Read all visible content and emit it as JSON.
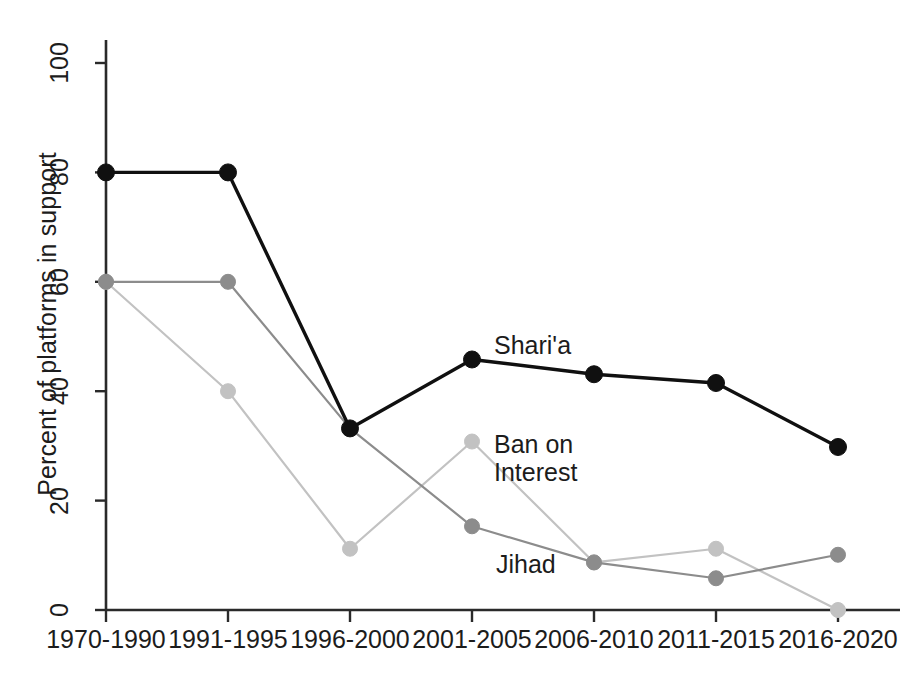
{
  "chart_data": {
    "type": "line",
    "title": "",
    "xlabel": "",
    "ylabel": "Percent of platforms in support",
    "ylim": [
      0,
      100
    ],
    "yticks": [
      0,
      20,
      40,
      60,
      80,
      100
    ],
    "ytick_labels": [
      "0",
      "20",
      "40",
      "60",
      "80",
      "100"
    ],
    "grid": false,
    "legend_position": "inline-annotations",
    "categories": [
      "1970-1990",
      "1991-1995",
      "1996-2000",
      "2001-2005",
      "2006-2010",
      "2011-2015",
      "2016-2020"
    ],
    "series": [
      {
        "name": "Shari'a",
        "color": "#101010",
        "values": [
          80,
          80,
          33.2,
          45.8,
          43.1,
          41.5,
          29.8
        ]
      },
      {
        "name": "Jihad",
        "color": "#8c8c8c",
        "values": [
          60,
          60,
          33.2,
          15.3,
          8.7,
          5.8,
          10.1
        ]
      },
      {
        "name": "Ban on Interest",
        "color": "#c2c2c2",
        "values": [
          60,
          40,
          11.2,
          30.8,
          8.7,
          11.2,
          0
        ]
      }
    ],
    "annotations": [
      {
        "text": "Shari'a",
        "series": "Shari'a"
      },
      {
        "text": "Ban on\nInterest",
        "series": "Ban on Interest"
      },
      {
        "text": "Jihad",
        "series": "Jihad"
      }
    ]
  }
}
